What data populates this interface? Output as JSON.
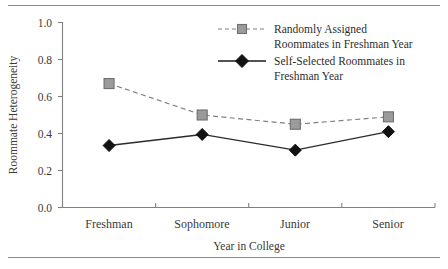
{
  "chart_data": {
    "type": "line",
    "title": "",
    "xlabel": "Year in College",
    "ylabel": "Roommate Heterogeneity",
    "categories": [
      "Freshman",
      "Sophomore",
      "Junior",
      "Senior"
    ],
    "ylim": [
      0.0,
      1.0
    ],
    "ytick_labels": [
      "0.0",
      "0.2",
      "0.4",
      "0.6",
      "0.8",
      "1.0"
    ],
    "ytick_values": [
      0.0,
      0.2,
      0.4,
      0.6,
      0.8,
      1.0
    ],
    "grid": false,
    "legend_position": "top-right",
    "series": [
      {
        "name": "Randomly Assigned Roommates in Freshman Year",
        "name_line1": "Randomly Assigned",
        "name_line2": "Roommates in Freshman Year",
        "values": [
          0.67,
          0.5,
          0.45,
          0.49
        ],
        "linestyle": "dashed",
        "marker": "square",
        "color": "#9b9b9b",
        "line_color": "#808080"
      },
      {
        "name": "Self-Selected Roommates in Freshman Year",
        "name_line1": "Self-Selected Roommates in",
        "name_line2": "Freshman Year",
        "values": [
          0.335,
          0.395,
          0.31,
          0.41
        ],
        "linestyle": "solid",
        "marker": "diamond",
        "color": "#121212",
        "line_color": "#2b2b2b"
      }
    ]
  },
  "figure": {
    "top_rule": "horizontal-rule",
    "bottom_rule": "horizontal-rule"
  }
}
